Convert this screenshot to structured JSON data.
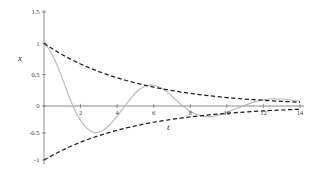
{
  "chart_data": {
    "type": "line",
    "title": "",
    "xlabel": "t",
    "ylabel": "x",
    "xlim": [
      0,
      14
    ],
    "ylim": [
      -1.0,
      1.5
    ],
    "grid": false,
    "legend_position": "none",
    "xticks": [
      2,
      4,
      6,
      8,
      10,
      12,
      14
    ],
    "xtick_labels": [
      "2",
      "4",
      "6",
      "8",
      "10",
      "12",
      "14"
    ],
    "yticks": [
      -1,
      -0.5,
      0,
      0.5,
      1,
      1.5
    ],
    "ytick_labels": [
      "-1",
      "-0.5",
      "0",
      "0.5",
      "1",
      "1.5"
    ],
    "series": [
      {
        "name": "damped oscillation",
        "style": "solid",
        "color": "#b9b9b9",
        "x": [
          0,
          0.25,
          0.5,
          0.75,
          1,
          1.25,
          1.5,
          1.75,
          2,
          2.25,
          2.5,
          2.75,
          3,
          3.25,
          3.5,
          3.75,
          4,
          4.25,
          4.5,
          4.75,
          5,
          5.25,
          5.5,
          5.75,
          6,
          6.25,
          6.5,
          6.75,
          7,
          7.25,
          7.5,
          7.75,
          8,
          8.25,
          8.5,
          8.75,
          9,
          9.25,
          9.5,
          9.75,
          10,
          10.5,
          11,
          11.5,
          12,
          12.5,
          13,
          13.5,
          14
        ],
        "y": [
          1.0,
          0.921,
          0.794,
          0.629,
          0.441,
          0.245,
          0.055,
          -0.119,
          -0.267,
          -0.381,
          -0.457,
          -0.492,
          -0.488,
          -0.449,
          -0.38,
          -0.29,
          -0.186,
          -0.078,
          0.028,
          0.125,
          0.208,
          0.272,
          0.315,
          0.334,
          0.332,
          0.31,
          0.27,
          0.217,
          0.155,
          0.088,
          0.021,
          -0.043,
          -0.098,
          -0.143,
          -0.175,
          -0.193,
          -0.198,
          -0.191,
          -0.173,
          -0.147,
          -0.116,
          -0.05,
          0.014,
          0.066,
          0.1,
          0.115,
          0.112,
          0.095,
          0.069
        ]
      },
      {
        "name": "upper envelope",
        "style": "dashed",
        "color": "#1d1d1d",
        "x": [
          0,
          0.5,
          1,
          1.5,
          2,
          2.5,
          3,
          3.5,
          4,
          4.5,
          5,
          5.5,
          6,
          6.5,
          7,
          7.5,
          8,
          8.5,
          9,
          9.5,
          10,
          10.5,
          11,
          11.5,
          12,
          12.5,
          13,
          13.5,
          14
        ],
        "y": [
          1.0,
          0.905,
          0.819,
          0.741,
          0.67,
          0.607,
          0.549,
          0.497,
          0.449,
          0.407,
          0.368,
          0.333,
          0.301,
          0.273,
          0.247,
          0.223,
          0.202,
          0.183,
          0.165,
          0.15,
          0.135,
          0.122,
          0.111,
          0.1,
          0.091,
          0.082,
          0.074,
          0.067,
          0.061
        ]
      },
      {
        "name": "lower envelope",
        "style": "dashed",
        "color": "#1d1d1d",
        "x": [
          0,
          0.5,
          1,
          1.5,
          2,
          2.5,
          3,
          3.5,
          4,
          4.5,
          5,
          5.5,
          6,
          6.5,
          7,
          7.5,
          8,
          8.5,
          9,
          9.5,
          10,
          10.5,
          11,
          11.5,
          12,
          12.5,
          13,
          13.5,
          14
        ],
        "y": [
          -1.0,
          -0.905,
          -0.819,
          -0.741,
          -0.67,
          -0.607,
          -0.549,
          -0.497,
          -0.449,
          -0.407,
          -0.368,
          -0.333,
          -0.301,
          -0.273,
          -0.247,
          -0.223,
          -0.202,
          -0.183,
          -0.165,
          -0.15,
          -0.135,
          -0.122,
          -0.111,
          -0.1,
          -0.091,
          -0.082,
          -0.074,
          -0.067,
          -0.061
        ]
      }
    ],
    "colors": {
      "axis": "#6d6d6d",
      "envelope": "#1d1d1d",
      "oscillation": "#b9b9b9",
      "text": "#2b2b2b",
      "background": "#ffffff"
    }
  }
}
